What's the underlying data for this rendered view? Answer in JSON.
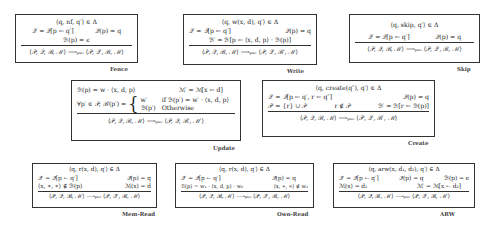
{
  "rules": {
    "fence": {
      "name": "Fence",
      "premise_top": "⟨q, nf, q′⟩ ∈ Δ",
      "premise_row1_left": "𝒬′ = 𝒬[p ← q′]",
      "premise_row1_right": "𝒬(p) = q",
      "premise_row2": "ℬ(p) = ϵ",
      "conclusion": "⟨𝒫, 𝒬, ℬ, ℳ⟩  ⟶ₚₛₒ  ⟨𝒫, 𝒬′, ℬ, ℳ⟩"
    },
    "write": {
      "name": "Write",
      "premise_top": "⟨q, w(x, d), q′⟩ ∈ Δ",
      "premise_row1_left": "𝒬′ = 𝒬[p ← q′]",
      "premise_row1_right": "𝒬(p) = q",
      "premise_row2": "ℬ′ = ℬ[p ← ⟨x, d, p⟩ · ℬ(p)]",
      "conclusion": "⟨𝒫, 𝒬, ℬ, ℳ⟩  ⟶ₚₛₒ  ⟨𝒫, 𝒬′, ℬ′, ℳ⟩"
    },
    "skip": {
      "name": "Skip",
      "premise_top": "⟨q, skip, q′⟩ ∈ Δ",
      "premise_row1_left": "𝒬′ = 𝒬[p ← q′]",
      "premise_row1_right": "𝒬(p) = q",
      "conclusion": "⟨𝒫, 𝒬, ℬ, ℳ⟩  ⟶ₚₛₒ  ⟨𝒫, 𝒬′, ℬ, ℳ⟩"
    },
    "update": {
      "name": "Update",
      "premise_row1_left": "ℬ(p) = w · ⟨x, d, p⟩",
      "premise_row1_right": "ℳ′ = ℳ[x ← d]",
      "premise_row2_lhs": "∀p′ ∈ 𝒫, ℬ′(p′) =",
      "case1_value": "w′",
      "case1_cond": "if ℬ(p′) = w′ · ⟨x, d, p⟩",
      "case2_value": "ℬ(p′)",
      "case2_cond": "Otherwise",
      "conclusion": "⟨𝒫, 𝒬, ℬ, ℳ⟩  ⟶ₚₛₒ  ⟨𝒫, 𝒬, ℬ′, ℳ′⟩"
    },
    "create": {
      "name": "Create",
      "premise_top": "⟨q, create(q″), q′⟩ ∈ Δ",
      "premise_row1_left": "𝒬′ = 𝒬[p ← q′, r ← q″]",
      "premise_row1_right": "𝒬(p) = q",
      "premise_row2_a": "𝒫′ = {r} ∪ 𝒫",
      "premise_row2_b": "r ∉ 𝒫",
      "premise_row2_c": "ℬ′ = ℬ[r ← ℬ(p)]",
      "conclusion": "⟨𝒫, 𝒬, ℬ, ℳ⟩  ⟶ₚₛₒ  ⟨𝒫′, 𝒬′, ℬ′, ℳ⟩"
    },
    "mem_read": {
      "name": "Mem-Read",
      "premise_top": "⟨q, r(x, d), q′⟩ ∈ Δ",
      "premise_row1_left": "𝒬′ = 𝒬[p ← q′]",
      "premise_row1_right": "𝒬(p) = q",
      "premise_row2_left": "⟨x, ∗, ∗⟩ ∉ ℬ(p)",
      "premise_row2_right": "ℳ(x) = d",
      "conclusion": "⟨𝒫, 𝒬, ℬ, ℳ⟩  ⟶ₚₛₒ  ⟨𝒫, 𝒬′, ℬ, ℳ⟩"
    },
    "own_read": {
      "name": "Own-Read",
      "premise_top": "⟨q, r(x, d), q′⟩ ∈ Δ",
      "premise_row1_left": "𝒬′ = 𝒬[p ← q′]",
      "premise_row1_right": "𝒬(p) = q",
      "premise_row2_left": "ℬ(p) = w₁ · ⟨x, d, p⟩ · w₂",
      "premise_row2_right": "⟨x, ∗, ∗⟩ ∉ w₁",
      "conclusion": "⟨𝒫, 𝒬, ℬ, ℳ⟩  ⟶ₚₛₒ  ⟨𝒫, 𝒬′, ℬ, ℳ⟩"
    },
    "arw": {
      "name": "ARW",
      "premise_top": "⟨q, arw(x, d₁, d₂), q′⟩ ∈ Δ",
      "premise_row1_a": "𝒬′ = 𝒬[p ← q′]",
      "premise_row1_b": "𝒬(p) = q",
      "premise_row1_c": "ℬ(p) = ϵ",
      "premise_row2_left": "ℳ(x) = d₁",
      "premise_row2_right": "ℳ′ = ℳ[x ← d₂]",
      "conclusion": "⟨𝒫, 𝒬, ℬ, ℳ⟩  ⟶ₚₛₒ  ⟨𝒫, 𝒬′, ℬ, ℳ′⟩"
    }
  }
}
